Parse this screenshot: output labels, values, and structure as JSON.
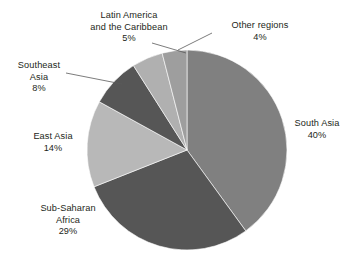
{
  "chart_data": {
    "type": "pie",
    "title": "",
    "subtitle": "",
    "xlabel": "",
    "ylabel": "",
    "legend_position": "callout-labels",
    "grid": false,
    "start_angle_deg": 0,
    "direction": "clockwise",
    "unit": "%",
    "categories": [
      "South Asia",
      "Sub-Saharan Africa",
      "East Asia",
      "Southeast Asia",
      "Latin America and the Caribbean",
      "Other regions"
    ],
    "values": [
      40,
      29,
      14,
      8,
      5,
      4
    ],
    "colors": [
      "#808080",
      "#565656",
      "#b8b8b8",
      "#565656",
      "#b0b0b0",
      "#9e9e9e"
    ],
    "slices": [
      {
        "key": "south-asia",
        "name": "South Asia",
        "value": 40,
        "value_label": "40%",
        "color": "#808080",
        "label_lines": [
          "South Asia"
        ],
        "has_leader_line": false
      },
      {
        "key": "sub-saharan-africa",
        "name": "Sub-Saharan Africa",
        "value": 29,
        "value_label": "29%",
        "color": "#565656",
        "label_lines": [
          "Sub-Saharan",
          "Africa"
        ],
        "has_leader_line": false
      },
      {
        "key": "east-asia",
        "name": "East Asia",
        "value": 14,
        "value_label": "14%",
        "color": "#b8b8b8",
        "label_lines": [
          "East Asia"
        ],
        "has_leader_line": false
      },
      {
        "key": "southeast-asia",
        "name": "Southeast Asia",
        "value": 8,
        "value_label": "8%",
        "color": "#565656",
        "label_lines": [
          "Southeast",
          "Asia"
        ],
        "has_leader_line": true
      },
      {
        "key": "latin-america",
        "name": "Latin America and the Caribbean",
        "value": 5,
        "value_label": "5%",
        "color": "#b0b0b0",
        "label_lines": [
          "Latin America",
          "and the Caribbean"
        ],
        "has_leader_line": true
      },
      {
        "key": "other-regions",
        "name": "Other regions",
        "value": 4,
        "value_label": "4%",
        "color": "#9e9e9e",
        "label_lines": [
          "Other regions"
        ],
        "has_leader_line": true
      }
    ]
  },
  "labels": {
    "latin_america": {
      "line1": "Latin America",
      "line2": "and the Caribbean",
      "pct": "5%"
    },
    "other_regions": {
      "line1": "Other regions",
      "pct": "4%"
    },
    "southeast_asia": {
      "line1": "Southeast",
      "line2": "Asia",
      "pct": "8%"
    },
    "east_asia": {
      "line1": "East Asia",
      "pct": "14%"
    },
    "sub_saharan_africa": {
      "line1": "Sub-Saharan",
      "line2": "Africa",
      "pct": "29%"
    },
    "south_asia": {
      "line1": "South Asia",
      "pct": "40%"
    }
  },
  "geometry": {
    "center_x": 187,
    "center_y": 150,
    "radius": 100
  },
  "style": {
    "background": "#ffffff",
    "text_color": "#231f20",
    "leader_line_color": "#5a5a5a"
  }
}
